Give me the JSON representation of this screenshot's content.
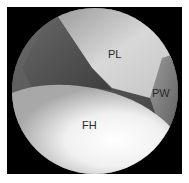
{
  "image": {
    "type": "arthroscopic-view",
    "labels": [
      {
        "id": "PL",
        "text": "PL",
        "x": 108,
        "y": 47
      },
      {
        "id": "PW",
        "text": "PW",
        "x": 152,
        "y": 85
      },
      {
        "id": "FH",
        "text": "FH",
        "x": 82,
        "y": 118
      }
    ]
  }
}
